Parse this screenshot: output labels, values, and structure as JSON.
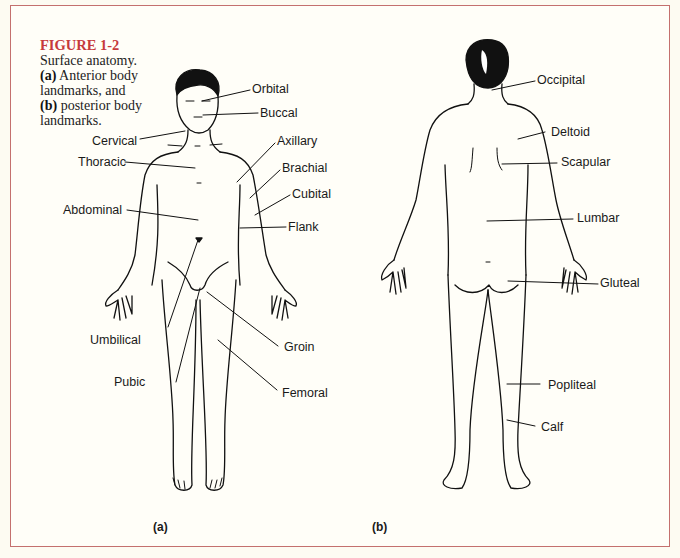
{
  "figure": {
    "title": "FIGURE 1-2",
    "description": "Surface anatomy.",
    "part_a_marker": "(a)",
    "part_a_text": " Anterior body landmarks, and",
    "part_b_marker": "(b)",
    "part_b_text": " posterior body landmarks.",
    "title_color": "#c63a3c",
    "border_color": "#c4706e"
  },
  "anterior": {
    "sublabel": "(a)",
    "labels": [
      "Orbital",
      "Buccal",
      "Cervical",
      "Thoracic",
      "Axillary",
      "Brachial",
      "Cubital",
      "Abdominal",
      "Flank",
      "Umbilical",
      "Groin",
      "Pubic",
      "Femoral"
    ]
  },
  "posterior": {
    "sublabel": "(b)",
    "labels": [
      "Occipital",
      "Deltoid",
      "Scapular",
      "Lumbar",
      "Gluteal",
      "Popliteal",
      "Calf"
    ]
  }
}
